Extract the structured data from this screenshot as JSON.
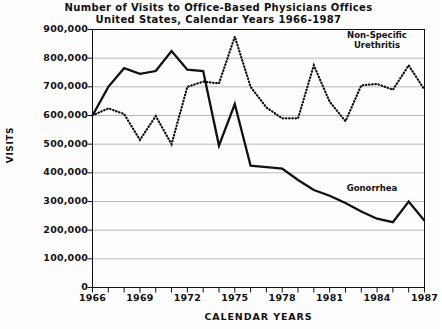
{
  "chart_data": {
    "type": "line",
    "title": "Number of Visits to Office-Based Physicians Offices",
    "subtitle": "United States, Calendar Years 1966-1987",
    "xlabel": "CALENDAR YEARS",
    "ylabel": "VISITS",
    "grid": true,
    "legend_position": "inline-annotations",
    "xlim": [
      1966,
      1987
    ],
    "ylim": [
      0,
      900000
    ],
    "ytick_labels": [
      "900,000",
      "800,000",
      "700,000",
      "600,000",
      "500,000",
      "400,000",
      "300,000",
      "200,000",
      "100,000",
      "0"
    ],
    "ytick_values": [
      900000,
      800000,
      700000,
      600000,
      500000,
      400000,
      300000,
      200000,
      100000,
      0
    ],
    "xtick_labels": [
      "1966",
      "1969",
      "1972",
      "1975",
      "1978",
      "1981",
      "1984",
      "1987"
    ],
    "xtick_values": [
      1966,
      1969,
      1972,
      1975,
      1978,
      1981,
      1984,
      1987
    ],
    "x": [
      1966,
      1967,
      1968,
      1969,
      1970,
      1971,
      1972,
      1973,
      1974,
      1975,
      1976,
      1977,
      1978,
      1979,
      1980,
      1981,
      1982,
      1983,
      1984,
      1985,
      1986,
      1987
    ],
    "series": [
      {
        "name": "Gonorrhea",
        "style": "solid",
        "color": "#111111",
        "values": [
          600000,
          700000,
          765000,
          745000,
          755000,
          825000,
          760000,
          755000,
          495000,
          640000,
          425000,
          420000,
          415000,
          375000,
          340000,
          320000,
          295000,
          265000,
          240000,
          228000,
          300000,
          233000
        ]
      },
      {
        "name": "Non-Specific Urethritis",
        "style": "dotted",
        "color": "#111111",
        "values": [
          600000,
          625000,
          605000,
          515000,
          598000,
          500000,
          700000,
          718000,
          712000,
          875000,
          700000,
          628000,
          590000,
          590000,
          775000,
          648000,
          580000,
          705000,
          710000,
          690000,
          775000,
          690000
        ]
      }
    ],
    "annotations": [
      {
        "id": "nsu",
        "text_line1": "Non-Specific",
        "text_line2": "Urethritis"
      },
      {
        "id": "gon",
        "text_line1": "Gonorrhea"
      }
    ]
  }
}
